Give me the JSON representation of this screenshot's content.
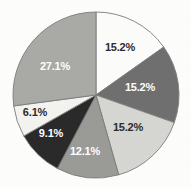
{
  "chart_data": {
    "type": "pie",
    "title": "",
    "subtitle": "",
    "xlabel": "",
    "ylabel": "",
    "legend": "none",
    "grid": false,
    "start_angle_deg": 0,
    "direction": "clockwise",
    "labels_shown": "percentage",
    "categories": [
      "Segment 1",
      "Segment 2",
      "Segment 3",
      "Segment 4",
      "Segment 5",
      "Segment 6",
      "Segment 7"
    ],
    "values": [
      15.2,
      15.2,
      15.2,
      12.1,
      9.1,
      6.1,
      27.1
    ],
    "value_labels": [
      "15.2%",
      "15.2%",
      "15.2%",
      "12.1%",
      "9.1%",
      "6.1%",
      "27.1%"
    ],
    "slice_colors": [
      "#fcfcfa",
      "#6f6f6f",
      "#d6d6d2",
      "#9a9a97",
      "#2a2a2a",
      "#f3f3f0",
      "#a9a9a6"
    ],
    "slice_label_colors": [
      "#2c2c2c",
      "#ffffff",
      "#2c2c2c",
      "#ffffff",
      "#ffffff",
      "#2c2c2c",
      "#ffffff"
    ],
    "outline_color": "#7c7c7c",
    "background_color": "#fdfdfc",
    "total": 100.0
  },
  "chart": {
    "center_x": 96,
    "center_y": 95,
    "radius": 83,
    "slices": [
      {
        "name": "slice-1",
        "label": "15.2%",
        "value": 15.2,
        "color": "#fcfcfa",
        "label_color": "#2c2c2c",
        "label_x": 120,
        "label_y": 48
      },
      {
        "name": "slice-2",
        "label": "15.2%",
        "value": 15.2,
        "color": "#6f6f6f",
        "label_color": "#ffffff",
        "label_x": 140,
        "label_y": 88
      },
      {
        "name": "slice-3",
        "label": "15.2%",
        "value": 15.2,
        "color": "#d6d6d2",
        "label_color": "#2c2c2c",
        "label_x": 128,
        "label_y": 128
      },
      {
        "name": "slice-4",
        "label": "12.1%",
        "value": 12.1,
        "color": "#9a9a97",
        "label_color": "#ffffff",
        "label_x": 85,
        "label_y": 152
      },
      {
        "name": "slice-5",
        "label": "9.1%",
        "value": 9.1,
        "color": "#2a2a2a",
        "label_color": "#ffffff",
        "label_x": 51,
        "label_y": 134
      },
      {
        "name": "slice-6",
        "label": "6.1%",
        "value": 6.1,
        "color": "#f3f3f0",
        "label_color": "#2c2c2c",
        "label_x": 35,
        "label_y": 113
      },
      {
        "name": "slice-7",
        "label": "27.1%",
        "value": 27.1,
        "color": "#a9a9a6",
        "label_color": "#ffffff",
        "label_x": 55,
        "label_y": 67
      }
    ]
  }
}
